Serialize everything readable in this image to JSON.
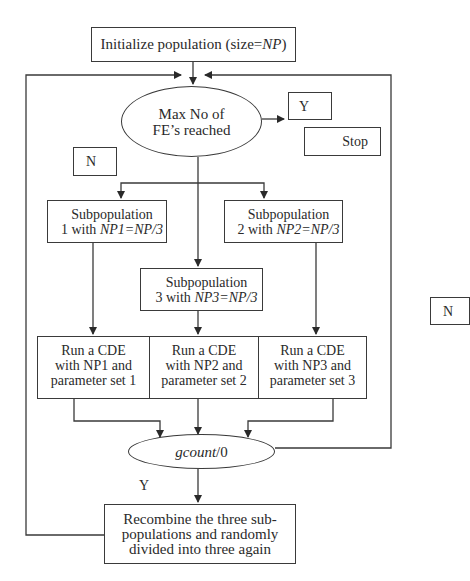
{
  "diagram": {
    "type": "flowchart",
    "title_fragment": "",
    "nodes": {
      "init": {
        "text": "Initialize population (size=",
        "italic": "NP",
        "tail": ")"
      },
      "max_fe": {
        "line1": "Max No of",
        "line2": "FE’s reached"
      },
      "yes_top": {
        "text": "Y"
      },
      "stop": {
        "text": "Stop"
      },
      "no_left": {
        "text": "N"
      },
      "no_right": {
        "text": "N"
      },
      "sub1": {
        "line1": "Subpopulation",
        "line2_pre": "1 with ",
        "line2_it": "NP1=NP/3"
      },
      "sub2": {
        "line1": "Subpopulation",
        "line2_pre": "2 with ",
        "line2_it": "NP2=NP/3"
      },
      "sub3": {
        "line1": "Subpopulation",
        "line2_pre": "3 with ",
        "line2_it": "NP3=NP/3"
      },
      "cde1": {
        "line1": "Run a CDE",
        "line2": "with NP1 and",
        "line3": "parameter set 1"
      },
      "cde2": {
        "line1": "Run a CDE",
        "line2": "with NP2 and",
        "line3": "parameter set 2"
      },
      "cde3": {
        "line1": "Run a CDE",
        "line2": "with NP3 and",
        "line3": "parameter set 3"
      },
      "gcount": {
        "italic": "gcount",
        "tail": "/0"
      },
      "yes_bottom": {
        "text": "Y"
      },
      "recombine": {
        "line1": "Recombine the three sub-",
        "line2": "populations and randomly",
        "line3": "divided into three again"
      }
    },
    "colors": {
      "stroke": "#3a3a3a",
      "text": "#2a2a2a",
      "background": "#ffffff"
    }
  }
}
